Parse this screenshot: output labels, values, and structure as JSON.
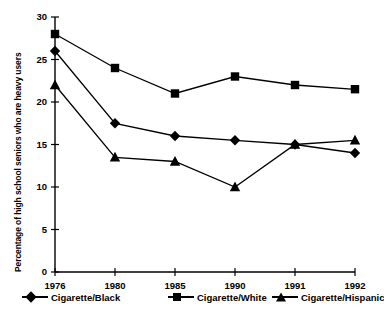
{
  "chart_data": {
    "type": "line",
    "title": "",
    "xlabel": "",
    "ylabel": "Percentage of high school seniors who are heavy users",
    "categories": [
      "1976",
      "1980",
      "1985",
      "1990",
      "1991",
      "1992"
    ],
    "ylim": [
      0,
      30
    ],
    "yticks": [
      0,
      5,
      10,
      15,
      20,
      25,
      30
    ],
    "ytick_labels": [
      "0",
      "5",
      "10",
      "15",
      "20",
      "25",
      "30"
    ],
    "grid": false,
    "legend_position": "bottom",
    "series": [
      {
        "name": "Cigarette/Black",
        "marker": "diamond",
        "color": "#000000",
        "values": [
          26,
          17.5,
          16,
          15.5,
          15,
          14
        ]
      },
      {
        "name": "Cigarette/White",
        "marker": "square",
        "color": "#000000",
        "values": [
          28,
          24,
          21,
          23,
          22,
          21.5
        ]
      },
      {
        "name": "Cigarette/Hispanic",
        "marker": "triangle",
        "color": "#000000",
        "values": [
          22,
          13.5,
          13,
          10,
          15,
          15.5
        ]
      }
    ]
  },
  "legend": {
    "items": [
      {
        "label": "Cigarette/Black",
        "marker": "diamond"
      },
      {
        "label": "Cigarette/White",
        "marker": "square"
      },
      {
        "label": "Cigarette/Hispanic",
        "marker": "triangle"
      }
    ]
  }
}
